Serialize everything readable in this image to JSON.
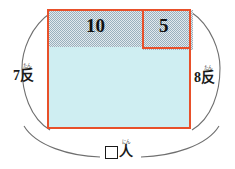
{
  "figure": {
    "region_labels": [
      {
        "name": "hatched-left-region",
        "value": "10"
      },
      {
        "name": "hatched-right-region",
        "value": "5"
      }
    ],
    "dimensions": {
      "left": {
        "number": "7",
        "unit": "反",
        "ruby": "たん",
        "full": "7反"
      },
      "right": {
        "number": "8",
        "unit": "反",
        "ruby": "たん",
        "full": "8反"
      },
      "bottom": {
        "number": "",
        "unit": "人",
        "ruby": "にん",
        "full": "□人",
        "is_blank": true
      }
    },
    "colors": {
      "outline": "#e8502a",
      "fill_lower": "#cfeef2",
      "hatch_ink": "#8fa6b4",
      "hatch_base": "#dfe6ea",
      "arc": "#6b6b6b",
      "text": "#111111"
    }
  }
}
